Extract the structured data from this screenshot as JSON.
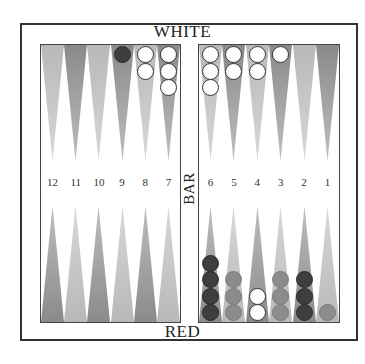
{
  "board": {
    "top_label": "WHITE",
    "bottom_label": "RED",
    "bar_label": "BAR",
    "colors": {
      "light_point": "#b8b8b8",
      "dark_point": "#8a8a8a",
      "white_checker": "#ffffff",
      "dark_checker": "#3e3e3e",
      "gray_checker": "#8c8c8c",
      "frame": "#333333"
    },
    "point_numbers": [
      "12",
      "11",
      "10",
      "9",
      "8",
      "7",
      "6",
      "5",
      "4",
      "3",
      "2",
      "1"
    ],
    "top_points": [
      {
        "col": 0,
        "shade": "light",
        "checkers": []
      },
      {
        "col": 1,
        "shade": "dark",
        "checkers": []
      },
      {
        "col": 2,
        "shade": "light",
        "checkers": []
      },
      {
        "col": 3,
        "shade": "dark",
        "checkers": [
          "dark"
        ]
      },
      {
        "col": 4,
        "shade": "light",
        "checkers": [
          "white",
          "white"
        ]
      },
      {
        "col": 5,
        "shade": "dark",
        "checkers": [
          "white",
          "white",
          "white"
        ]
      },
      {
        "col": 6,
        "shade": "light",
        "checkers": [
          "white",
          "white",
          "white"
        ]
      },
      {
        "col": 7,
        "shade": "dark",
        "checkers": [
          "white",
          "white"
        ]
      },
      {
        "col": 8,
        "shade": "light",
        "checkers": [
          "white",
          "white"
        ]
      },
      {
        "col": 9,
        "shade": "dark",
        "checkers": [
          "white"
        ]
      },
      {
        "col": 10,
        "shade": "light",
        "checkers": []
      },
      {
        "col": 11,
        "shade": "dark",
        "checkers": []
      }
    ],
    "bottom_points": [
      {
        "col": 0,
        "number": "12",
        "shade": "dark",
        "checkers": []
      },
      {
        "col": 1,
        "number": "11",
        "shade": "light",
        "checkers": []
      },
      {
        "col": 2,
        "number": "10",
        "shade": "dark",
        "checkers": []
      },
      {
        "col": 3,
        "number": "9",
        "shade": "light",
        "checkers": []
      },
      {
        "col": 4,
        "number": "8",
        "shade": "dark",
        "checkers": []
      },
      {
        "col": 5,
        "number": "7",
        "shade": "light",
        "checkers": []
      },
      {
        "col": 6,
        "number": "6",
        "shade": "dark",
        "checkers": [
          "dark",
          "dark",
          "dark",
          "dark"
        ]
      },
      {
        "col": 7,
        "number": "5",
        "shade": "light",
        "checkers": [
          "gray",
          "gray",
          "gray"
        ]
      },
      {
        "col": 8,
        "number": "4",
        "shade": "dark",
        "checkers": [
          "white",
          "white"
        ]
      },
      {
        "col": 9,
        "number": "3",
        "shade": "light",
        "checkers": [
          "gray",
          "gray",
          "gray"
        ]
      },
      {
        "col": 10,
        "number": "2",
        "shade": "dark",
        "checkers": [
          "dark",
          "dark",
          "dark"
        ]
      },
      {
        "col": 11,
        "number": "1",
        "shade": "light",
        "checkers": [
          "gray"
        ]
      }
    ]
  }
}
